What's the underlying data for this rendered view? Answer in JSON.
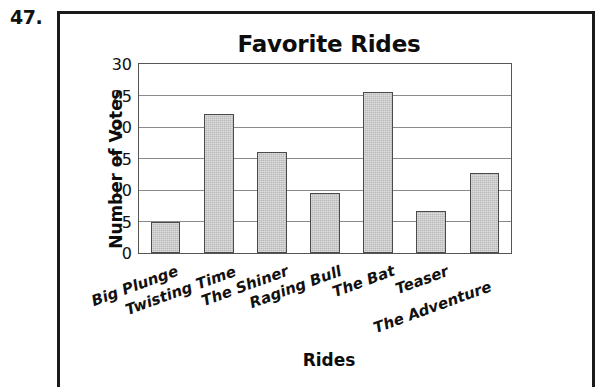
{
  "problem": {
    "number": "47."
  },
  "chart_data": {
    "type": "bar",
    "title": "Favorite Rides",
    "xlabel": "Rides",
    "ylabel": "Number of Votes",
    "categories": [
      "Big Plunge",
      "Twisting Time",
      "The Shiner",
      "Raging Bull",
      "The Bat",
      "Teaser",
      "The Adventure"
    ],
    "values": [
      5,
      22,
      16,
      9.5,
      25.5,
      6.7,
      12.7
    ],
    "ylim": [
      0,
      30
    ],
    "ytick_labels": [
      "0",
      "5",
      "10",
      "15",
      "20",
      "25",
      "30"
    ],
    "ytick_values": [
      0,
      5,
      10,
      15,
      20,
      25,
      30
    ],
    "grid": "horizontal",
    "legend": "none",
    "bar_color": "#b9b9b9",
    "bar_border_color": "#4a4a4a",
    "axis_color": "#555555",
    "frame_color": "#1a1a1a",
    "text_color": "#111111",
    "xtick_rotation_degrees": -20
  }
}
